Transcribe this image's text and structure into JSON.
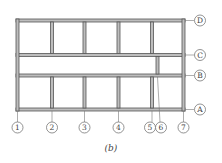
{
  "figure": {
    "caption": "(b)",
    "column_axes": [
      "1",
      "2",
      "3",
      "4",
      "5",
      "6",
      "7"
    ],
    "row_axes": [
      "D",
      "C",
      "B",
      "A"
    ],
    "colors": {
      "line": "#555555",
      "fill": "#bbbbbb"
    }
  }
}
